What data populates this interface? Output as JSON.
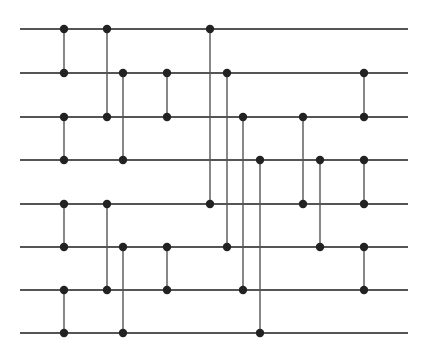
{
  "diagram": {
    "type": "sorting-network",
    "wire_count": 8,
    "wire_x_start": 20,
    "wire_x_end": 408,
    "wire_y": [
      29,
      73,
      117,
      160,
      204,
      247,
      290,
      333
    ],
    "colors": {
      "wire": "#555555",
      "comparator": "#555555",
      "node": "#222222",
      "background": "#ffffff"
    },
    "comparators": [
      {
        "x": 64,
        "a": 0,
        "b": 1
      },
      {
        "x": 64,
        "a": 2,
        "b": 3
      },
      {
        "x": 64,
        "a": 4,
        "b": 5
      },
      {
        "x": 64,
        "a": 6,
        "b": 7
      },
      {
        "x": 107,
        "a": 0,
        "b": 2
      },
      {
        "x": 107,
        "a": 4,
        "b": 6
      },
      {
        "x": 123,
        "a": 1,
        "b": 3
      },
      {
        "x": 123,
        "a": 5,
        "b": 7
      },
      {
        "x": 167,
        "a": 1,
        "b": 2
      },
      {
        "x": 167,
        "a": 5,
        "b": 6
      },
      {
        "x": 210,
        "a": 0,
        "b": 4
      },
      {
        "x": 227,
        "a": 1,
        "b": 5
      },
      {
        "x": 243,
        "a": 2,
        "b": 6
      },
      {
        "x": 260,
        "a": 3,
        "b": 7
      },
      {
        "x": 303,
        "a": 2,
        "b": 4
      },
      {
        "x": 320,
        "a": 3,
        "b": 5
      },
      {
        "x": 364,
        "a": 1,
        "b": 2
      },
      {
        "x": 364,
        "a": 3,
        "b": 4
      },
      {
        "x": 364,
        "a": 5,
        "b": 6
      }
    ]
  }
}
